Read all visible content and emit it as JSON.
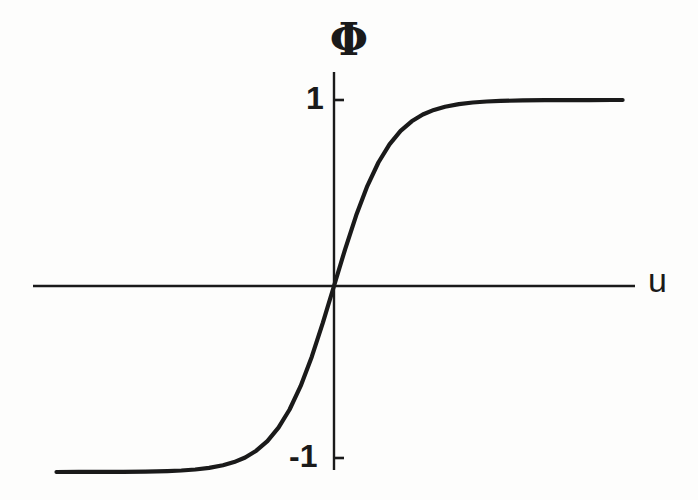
{
  "figure": {
    "background_color": "#fdfdfc",
    "ink_color": "#1a1a1a",
    "width": 698,
    "height": 500
  },
  "labels": {
    "y_axis_symbol": "Φ",
    "x_axis_symbol": "u",
    "y_tick_top": "1",
    "y_tick_bottom": "-1"
  },
  "chart_data": {
    "type": "line",
    "title": "",
    "subtitle": "",
    "xlabel": "u",
    "ylabel": "Φ",
    "grid": false,
    "legend": null,
    "series": [
      {
        "name": "Φ(u)",
        "function": "tanh",
        "x": [
          -5.0,
          -4.6,
          -4.2,
          -3.8,
          -3.4,
          -3.0,
          -2.75,
          -2.5,
          -2.25,
          -2.0,
          -1.8,
          -1.6,
          -1.4,
          -1.2,
          -1.0,
          -0.8,
          -0.6,
          -0.4,
          -0.2,
          0.0,
          0.2,
          0.4,
          0.6,
          0.8,
          1.0,
          1.2,
          1.4,
          1.6,
          1.8,
          2.0,
          2.25,
          2.5,
          2.75,
          3.0,
          3.4,
          3.8,
          4.2,
          4.6,
          5.0,
          5.2
        ],
        "y": [
          -0.9999,
          -0.9998,
          -0.9996,
          -0.9991,
          -0.9978,
          -0.9951,
          -0.9919,
          -0.9866,
          -0.978,
          -0.964,
          -0.9468,
          -0.9217,
          -0.8854,
          -0.8337,
          -0.7616,
          -0.664,
          -0.537,
          -0.3799,
          -0.1974,
          0.0,
          0.1974,
          0.3799,
          0.537,
          0.664,
          0.7616,
          0.8337,
          0.8854,
          0.9217,
          0.9468,
          0.964,
          0.978,
          0.9866,
          0.9919,
          0.9951,
          0.9978,
          0.9991,
          0.9996,
          0.9998,
          0.9999,
          0.9999
        ]
      }
    ],
    "xlim": [
      -5.45,
      6.35
    ],
    "ylim": [
      -1.15,
      1.15
    ],
    "yticks": [
      -1,
      1
    ],
    "ytick_labels": [
      "-1",
      "1"
    ],
    "xticks": [],
    "xtick_labels": [],
    "annotations": []
  },
  "geometry": {
    "origin_x": 334,
    "origin_y": 286,
    "x_axis_start": 33,
    "x_axis_end": 635,
    "y_axis_top": 72,
    "y_axis_bottom": 470,
    "unit_y_px": 186,
    "unit_x_px": 55.5,
    "curve_start_x": 52,
    "curve_end_x": 626,
    "tick_length": 9,
    "axis_stroke_width": 2.4,
    "curve_stroke_width": 4.2
  }
}
